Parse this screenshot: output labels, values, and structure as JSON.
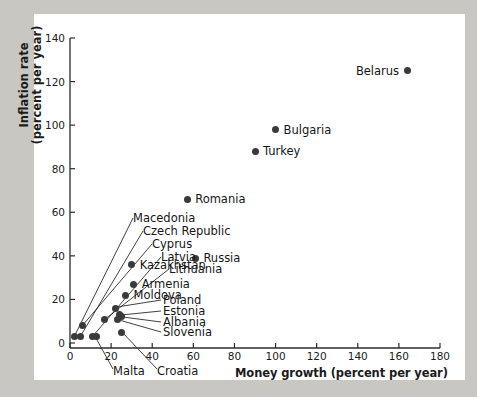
{
  "figure": {
    "background_color": "#c9c7c2",
    "paper_color": "#ffffff",
    "marker_color": "#3a3a3a",
    "axis_color": "#2b2b2b"
  },
  "chart_data": {
    "type": "scatter",
    "title": "",
    "xlabel": "Money growth (percent per year)",
    "ylabel_line1": "Inflation rate",
    "ylabel_line2": "(percent per year)",
    "xlim": [
      0,
      180
    ],
    "ylim": [
      0,
      140
    ],
    "xticks": [
      0,
      20,
      40,
      60,
      80,
      100,
      120,
      140,
      160,
      180
    ],
    "yticks": [
      0,
      20,
      40,
      60,
      80,
      100,
      120,
      140
    ],
    "grid": false,
    "legend": "none",
    "points": [
      {
        "name": "Belarus",
        "x": 164,
        "y": 125,
        "label_side": "left"
      },
      {
        "name": "Bulgaria",
        "x": 100,
        "y": 98,
        "label_side": "right"
      },
      {
        "name": "Turkey",
        "x": 90,
        "y": 88,
        "label_side": "right"
      },
      {
        "name": "Romania",
        "x": 57,
        "y": 66,
        "label_side": "right"
      },
      {
        "name": "Russia",
        "x": 61,
        "y": 39,
        "label_side": "right"
      },
      {
        "name": "Kazakhstan",
        "x": 30,
        "y": 36,
        "label_side": "right"
      },
      {
        "name": "Armenia",
        "x": 31,
        "y": 27,
        "label_side": "right"
      },
      {
        "name": "Moldova",
        "x": 27,
        "y": 22,
        "label_side": "right"
      },
      {
        "name": "Poland",
        "x": 22,
        "y": 16,
        "label_side": "leader"
      },
      {
        "name": "Estonia",
        "x": 24,
        "y": 13,
        "label_side": "leader"
      },
      {
        "name": "Albania",
        "x": 25,
        "y": 12,
        "label_side": "leader"
      },
      {
        "name": "Slovenia",
        "x": 23,
        "y": 11,
        "label_side": "leader"
      },
      {
        "name": "Macedonia",
        "x": 2,
        "y": 3,
        "label_side": "leader"
      },
      {
        "name": "Czech Republic",
        "x": 5,
        "y": 3,
        "label_side": "leader"
      },
      {
        "name": "Cyprus",
        "x": 6,
        "y": 8,
        "label_side": "leader"
      },
      {
        "name": "Latvia",
        "x": 11,
        "y": 3,
        "label_side": "leader"
      },
      {
        "name": "Lithuania",
        "x": 17,
        "y": 11,
        "label_side": "leader"
      },
      {
        "name": "Malta",
        "x": 13,
        "y": 3,
        "label_side": "leader-below"
      },
      {
        "name": "Croatia",
        "x": 25,
        "y": 5,
        "label_side": "leader-below"
      }
    ],
    "annotations": [
      "Macedonia",
      "Czech Republic",
      "Cyprus",
      "Latvia",
      "Lithuania",
      "Kazakhstan",
      "Armenia",
      "Moldova",
      "Poland",
      "Estonia",
      "Albania",
      "Slovenia",
      "Malta",
      "Croatia",
      "Romania",
      "Russia",
      "Bulgaria",
      "Turkey",
      "Belarus"
    ]
  }
}
